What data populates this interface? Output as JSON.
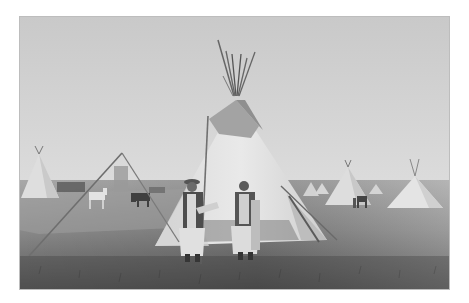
{
  "photo": {
    "subject": "tipi-encampment",
    "palette": {
      "sky_top": "#cdcdcd",
      "sky_bottom": "#dedede",
      "ground_far": "#a9a9a9",
      "ground_mid": "#8c8c8c",
      "ground_near": "#5e5e5e",
      "tipi_light": "#e6e6e6",
      "tipi_shade": "#c4c4c4",
      "tipi_top_dark": "#9a9a9a",
      "figure_dark": "#4a4a4a",
      "figure_light": "#d9d9d9",
      "pole": "#6b6b6b",
      "horse": "#3f3f3f"
    }
  }
}
